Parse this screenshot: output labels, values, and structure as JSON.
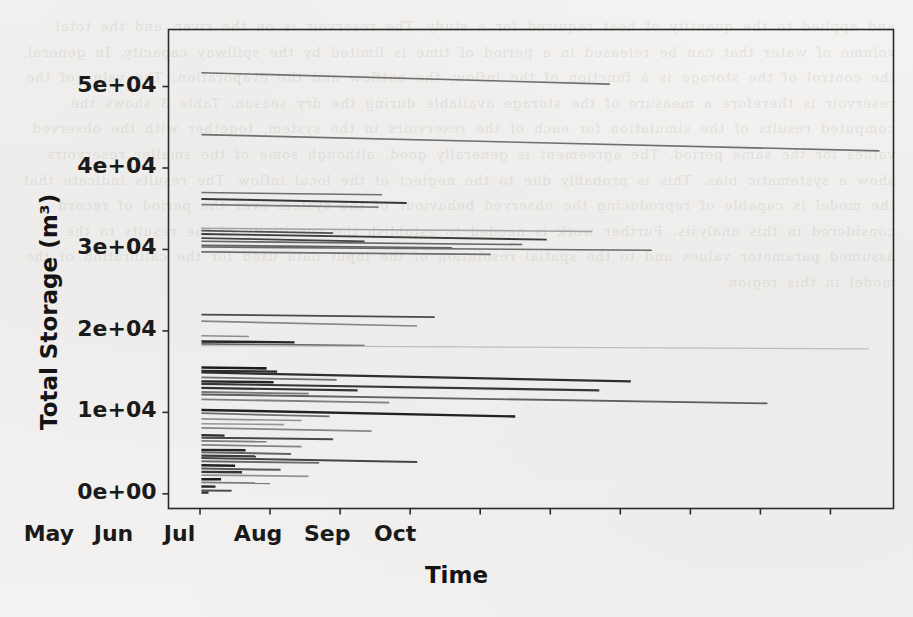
{
  "page": {
    "background_color": "#f2f1ef",
    "ink_color": "#1a1a1a",
    "ghost_text": "and applied to the quantity of heat required for a study. The reservoir is on the river, and the total volume of water that can be released in a period of time is limited by the spillway capacity. In general, the control of the storage is a function of the inflow, the outflow and the evaporation. The value of the reservoir is therefore a measure of the storage available during the dry season. Table 3 shows the computed results of the simulation for each of the reservoirs in the system, together with the observed values for the same period. The agreement is generally good, although some of the smaller reservoirs show a systematic bias. This is probably due to the neglect of the local inflow. The results indicate that the model is capable of reproducing the observed behaviour of the system over the period of record considered in this analysis. Further work is needed to establish the sensitivity of the results to the assumed parameter values and to the spatial resolution of the input data used for the calibration of the model in this region."
  },
  "chart_data": {
    "type": "line",
    "title": "",
    "xlabel": "Time",
    "ylabel": "Total Storage (m³)",
    "grid": false,
    "legend": null,
    "x_tick_labels": [
      "Jan",
      "Feb",
      "Mar",
      "Apr",
      "May",
      "Jun",
      "Jul",
      "Aug",
      "Sep",
      "Oct"
    ],
    "x_tick_months": [
      0,
      1,
      2,
      3,
      4,
      5,
      6,
      7,
      8,
      9
    ],
    "xlim": [
      -0.45,
      9.9
    ],
    "y_tick_labels": [
      "0e+00",
      "1e+04",
      "2e+04",
      "3e+04",
      "4e+04",
      "5e+04"
    ],
    "y_tick_values": [
      0,
      10000,
      20000,
      30000,
      40000,
      50000
    ],
    "ylim": [
      -1800,
      57000
    ],
    "series": [
      {
        "name": "res-01",
        "x_start": 0.02,
        "x_end": 5.85,
        "y_start": 51700,
        "y_end": 50300,
        "shade": 0.55,
        "width": 1.6
      },
      {
        "name": "res-02",
        "x_start": 0.02,
        "x_end": 9.7,
        "y_start": 44100,
        "y_end": 42100,
        "shade": 0.55,
        "width": 1.6
      },
      {
        "name": "res-03",
        "x_start": 0.02,
        "x_end": 2.6,
        "y_start": 37000,
        "y_end": 36700,
        "shade": 0.55,
        "width": 1.5
      },
      {
        "name": "res-04",
        "x_start": 0.02,
        "x_end": 2.95,
        "y_start": 36200,
        "y_end": 35700,
        "shade": 0.8,
        "width": 2.1
      },
      {
        "name": "res-05",
        "x_start": 0.02,
        "x_end": 2.55,
        "y_start": 35500,
        "y_end": 35200,
        "shade": 0.5,
        "width": 1.6
      },
      {
        "name": "res-06",
        "x_start": 0.02,
        "x_end": 5.6,
        "y_start": 32600,
        "y_end": 32200,
        "shade": 0.32,
        "width": 1.5
      },
      {
        "name": "res-07",
        "x_start": 0.02,
        "x_end": 1.9,
        "y_start": 32300,
        "y_end": 32000,
        "shade": 0.7,
        "width": 1.7
      },
      {
        "name": "res-08",
        "x_start": 0.02,
        "x_end": 4.95,
        "y_start": 31900,
        "y_end": 31200,
        "shade": 0.78,
        "width": 1.9
      },
      {
        "name": "res-09",
        "x_start": 0.02,
        "x_end": 2.35,
        "y_start": 31400,
        "y_end": 31000,
        "shade": 0.75,
        "width": 1.8
      },
      {
        "name": "res-10",
        "x_start": 0.02,
        "x_end": 4.6,
        "y_start": 31000,
        "y_end": 30600,
        "shade": 0.6,
        "width": 1.6
      },
      {
        "name": "res-11",
        "x_start": 0.02,
        "x_end": 3.6,
        "y_start": 30500,
        "y_end": 30200,
        "shade": 0.62,
        "width": 1.6
      },
      {
        "name": "res-12",
        "x_start": 0.02,
        "x_end": 6.45,
        "y_start": 30300,
        "y_end": 29900,
        "shade": 0.58,
        "width": 1.6
      },
      {
        "name": "res-13",
        "x_start": 0.02,
        "x_end": 4.15,
        "y_start": 29700,
        "y_end": 29400,
        "shade": 0.55,
        "width": 1.6
      },
      {
        "name": "res-14",
        "x_start": 0.02,
        "x_end": 3.35,
        "y_start": 22000,
        "y_end": 21700,
        "shade": 0.72,
        "width": 1.8
      },
      {
        "name": "res-15",
        "x_start": 0.02,
        "x_end": 3.1,
        "y_start": 21200,
        "y_end": 20600,
        "shade": 0.45,
        "width": 1.6
      },
      {
        "name": "res-16",
        "x_start": 0.02,
        "x_end": 0.7,
        "y_start": 19400,
        "y_end": 19300,
        "shade": 0.42,
        "width": 1.5
      },
      {
        "name": "res-17",
        "x_start": 0.02,
        "x_end": 1.35,
        "y_start": 18700,
        "y_end": 18600,
        "shade": 0.88,
        "width": 2.3
      },
      {
        "name": "res-18",
        "x_start": 0.02,
        "x_end": 2.35,
        "y_start": 18400,
        "y_end": 18200,
        "shade": 0.6,
        "width": 1.7
      },
      {
        "name": "res-19",
        "x_start": 0.02,
        "x_end": 9.55,
        "y_start": 18200,
        "y_end": 17800,
        "shade": 0.2,
        "width": 1.3
      },
      {
        "name": "res-20",
        "x_start": 0.02,
        "x_end": 0.95,
        "y_start": 15500,
        "y_end": 15400,
        "shade": 0.92,
        "width": 2.6
      },
      {
        "name": "res-21",
        "x_start": 0.02,
        "x_end": 1.1,
        "y_start": 15100,
        "y_end": 15000,
        "shade": 0.86,
        "width": 2.4
      },
      {
        "name": "res-22",
        "x_start": 0.02,
        "x_end": 6.15,
        "y_start": 14900,
        "y_end": 13800,
        "shade": 0.84,
        "width": 2.3
      },
      {
        "name": "res-23",
        "x_start": 0.02,
        "x_end": 1.95,
        "y_start": 14300,
        "y_end": 14000,
        "shade": 0.55,
        "width": 1.7
      },
      {
        "name": "res-24",
        "x_start": 0.02,
        "x_end": 1.05,
        "y_start": 13800,
        "y_end": 13700,
        "shade": 0.88,
        "width": 2.4
      },
      {
        "name": "res-25",
        "x_start": 0.02,
        "x_end": 5.7,
        "y_start": 13500,
        "y_end": 12700,
        "shade": 0.8,
        "width": 2.1
      },
      {
        "name": "res-26",
        "x_start": 0.02,
        "x_end": 2.25,
        "y_start": 13000,
        "y_end": 12700,
        "shade": 0.82,
        "width": 2.2
      },
      {
        "name": "res-27",
        "x_start": 0.02,
        "x_end": 1.55,
        "y_start": 12500,
        "y_end": 12300,
        "shade": 0.52,
        "width": 1.8
      },
      {
        "name": "res-28",
        "x_start": 0.02,
        "x_end": 8.1,
        "y_start": 12200,
        "y_end": 11100,
        "shade": 0.62,
        "width": 1.9
      },
      {
        "name": "res-29",
        "x_start": 0.02,
        "x_end": 2.7,
        "y_start": 11600,
        "y_end": 11200,
        "shade": 0.48,
        "width": 1.8
      },
      {
        "name": "res-30",
        "x_start": 0.02,
        "x_end": 4.5,
        "y_start": 10300,
        "y_end": 9500,
        "shade": 0.9,
        "width": 2.4
      },
      {
        "name": "res-31",
        "x_start": 0.02,
        "x_end": 1.85,
        "y_start": 9900,
        "y_end": 9500,
        "shade": 0.55,
        "width": 1.8
      },
      {
        "name": "res-32",
        "x_start": 0.02,
        "x_end": 1.45,
        "y_start": 9200,
        "y_end": 9000,
        "shade": 0.4,
        "width": 1.7
      },
      {
        "name": "res-33",
        "x_start": 0.02,
        "x_end": 1.2,
        "y_start": 8600,
        "y_end": 8500,
        "shade": 0.38,
        "width": 1.6
      },
      {
        "name": "res-34",
        "x_start": 0.02,
        "x_end": 2.45,
        "y_start": 8100,
        "y_end": 7700,
        "shade": 0.45,
        "width": 1.7
      },
      {
        "name": "res-35",
        "x_start": 0.02,
        "x_end": 0.35,
        "y_start": 7200,
        "y_end": 7150,
        "shade": 0.85,
        "width": 2.2
      },
      {
        "name": "res-36",
        "x_start": 0.02,
        "x_end": 1.9,
        "y_start": 6900,
        "y_end": 6700,
        "shade": 0.72,
        "width": 2.0
      },
      {
        "name": "res-37",
        "x_start": 0.02,
        "x_end": 0.95,
        "y_start": 6500,
        "y_end": 6400,
        "shade": 0.5,
        "width": 1.8
      },
      {
        "name": "res-38",
        "x_start": 0.02,
        "x_end": 1.45,
        "y_start": 6000,
        "y_end": 5800,
        "shade": 0.46,
        "width": 1.8
      },
      {
        "name": "res-39",
        "x_start": 0.02,
        "x_end": 0.65,
        "y_start": 5400,
        "y_end": 5350,
        "shade": 0.88,
        "width": 2.4
      },
      {
        "name": "res-40",
        "x_start": 0.02,
        "x_end": 1.3,
        "y_start": 5100,
        "y_end": 4900,
        "shade": 0.6,
        "width": 2.0
      },
      {
        "name": "res-41",
        "x_start": 0.02,
        "x_end": 0.8,
        "y_start": 4700,
        "y_end": 4600,
        "shade": 0.78,
        "width": 2.2
      },
      {
        "name": "res-42",
        "x_start": 0.02,
        "x_end": 3.1,
        "y_start": 4400,
        "y_end": 3900,
        "shade": 0.74,
        "width": 2.1
      },
      {
        "name": "res-43",
        "x_start": 0.02,
        "x_end": 1.7,
        "y_start": 4000,
        "y_end": 3800,
        "shade": 0.58,
        "width": 1.9
      },
      {
        "name": "res-44",
        "x_start": 0.02,
        "x_end": 0.5,
        "y_start": 3500,
        "y_end": 3450,
        "shade": 0.9,
        "width": 2.5
      },
      {
        "name": "res-45",
        "x_start": 0.02,
        "x_end": 1.15,
        "y_start": 3100,
        "y_end": 2950,
        "shade": 0.66,
        "width": 2.0
      },
      {
        "name": "res-46",
        "x_start": 0.02,
        "x_end": 0.6,
        "y_start": 2700,
        "y_end": 2650,
        "shade": 0.82,
        "width": 2.3
      },
      {
        "name": "res-47",
        "x_start": 0.02,
        "x_end": 1.55,
        "y_start": 2300,
        "y_end": 2150,
        "shade": 0.4,
        "width": 1.8
      },
      {
        "name": "res-48",
        "x_start": 0.02,
        "x_end": 0.3,
        "y_start": 1800,
        "y_end": 1780,
        "shade": 0.92,
        "width": 2.5
      },
      {
        "name": "res-49",
        "x_start": 0.02,
        "x_end": 1.0,
        "y_start": 1400,
        "y_end": 1300,
        "shade": 0.5,
        "width": 1.8
      },
      {
        "name": "res-50",
        "x_start": 0.02,
        "x_end": 0.22,
        "y_start": 900,
        "y_end": 880,
        "shade": 0.88,
        "width": 2.4
      },
      {
        "name": "res-51",
        "x_start": 0.02,
        "x_end": 0.45,
        "y_start": 400,
        "y_end": 380,
        "shade": 0.7,
        "width": 2.0
      },
      {
        "name": "res-52",
        "x_start": 0.02,
        "x_end": 0.12,
        "y_start": 150,
        "y_end": 140,
        "shade": 0.85,
        "width": 2.2
      }
    ]
  }
}
